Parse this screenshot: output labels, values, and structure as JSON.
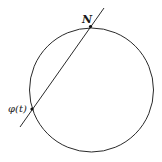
{
  "diagram": {
    "type": "stereographic-projection",
    "circle": {
      "cx": 91.5,
      "cy": 90,
      "r": 62,
      "stroke": "#2a2a2a"
    },
    "line": {
      "x1": 20,
      "y1": 127,
      "x2": 104,
      "y2": 8,
      "stroke": "#2a2a2a"
    },
    "points": [
      {
        "id": "north-pole",
        "label": "N",
        "x": 90.5,
        "y": 26.5,
        "label_x": 82,
        "label_y": 23
      },
      {
        "id": "phi-t",
        "label": "φ(t)",
        "x": 32,
        "y": 109,
        "label_x": 8,
        "label_y": 112
      }
    ]
  }
}
